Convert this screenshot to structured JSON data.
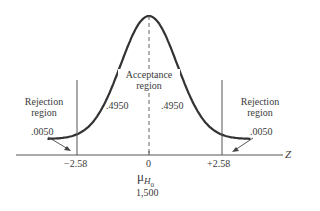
{
  "diagram": {
    "type": "normal-distribution-two-tailed-test",
    "axis_label": "Z",
    "center_tick": "0",
    "critical_left": "−2.58",
    "critical_right": "+2.58",
    "mean_label_symbol": "μ",
    "mean_label_subscript": "H",
    "mean_label_subsubscript": "0",
    "mean_value": "1,500",
    "acceptance_region": {
      "line1": "Acceptance",
      "line2": "region"
    },
    "acceptance_left_prob": ".4950",
    "acceptance_right_prob": ".4950",
    "rejection_left": {
      "line1": "Rejection",
      "line2": "region",
      "prob": ".0050"
    },
    "rejection_right": {
      "line1": "Rejection",
      "line2": "region",
      "prob": ".0050"
    },
    "z_critical_values": [
      -2.58,
      2.58
    ],
    "z_display_range": [
      -3.6,
      3.6
    ]
  }
}
